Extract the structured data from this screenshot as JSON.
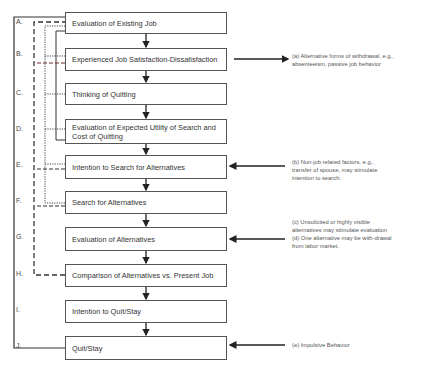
{
  "steps": [
    {
      "letter": "A.",
      "label": "Evaluation of Existing Job"
    },
    {
      "letter": "B.",
      "label": "Experienced Job Satisfaction-Dissatisfaction"
    },
    {
      "letter": "C.",
      "label": "Thinking of Quitting"
    },
    {
      "letter": "D.",
      "label": "Evaluation of Expected Utility of Search and Cost of Quitting"
    },
    {
      "letter": "E.",
      "label": "Intention to Search for Alternatives"
    },
    {
      "letter": "F.",
      "label": "Search for Alternatives"
    },
    {
      "letter": "G.",
      "label": "Evaluation of Alternatives"
    },
    {
      "letter": "H.",
      "label": "Comparison of Alternatives vs. Present Job"
    },
    {
      "letter": "I.",
      "label": "Intention to Quit/Stay"
    },
    {
      "letter": "J.",
      "label": "Quit/Stay"
    }
  ],
  "notes": [
    {
      "id": "a",
      "step": "B",
      "direction": "outgoing",
      "text": "(a) Alternative forms of withdrawal, e.g., absenteeism, passive job behavior"
    },
    {
      "id": "b",
      "step": "E",
      "direction": "incoming",
      "text": "(b) Non-job related factors, e.g., transfer of spouse, may stimulate intention to search."
    },
    {
      "id": "cd",
      "step": "G",
      "direction": "incoming",
      "text": "(c) Unsolicited or highly visible alternatives may stimulate evaluation\n(d) One alternative may be with-drawal from labor market."
    },
    {
      "id": "e",
      "step": "J",
      "direction": "incoming",
      "text": "(e) Impulsive Behavior"
    }
  ],
  "feedback_paths": [
    {
      "style": "solid",
      "from": "J",
      "to": "A"
    },
    {
      "style": "long-dash",
      "from": "H",
      "to": "A"
    },
    {
      "style": "dotted",
      "from": "F",
      "to": "A"
    },
    {
      "style": "solid",
      "from": "D",
      "to": "A"
    },
    {
      "style": "dashed",
      "from": "F",
      "to": "B"
    },
    {
      "style": "dotted",
      "from": "C",
      "to": "B"
    }
  ],
  "colors": {
    "line": "#333333",
    "text": "#3a3a3a",
    "background": "#ffffff",
    "accent_dash": "#6a2a2a"
  }
}
